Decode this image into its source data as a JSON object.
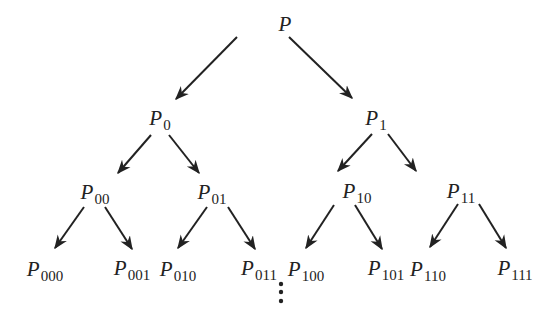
{
  "diagram": {
    "type": "binary-tree",
    "line_color": "#222222",
    "nodes": [
      {
        "id": "root",
        "base": "P",
        "sub": "",
        "x": 285,
        "y": 24
      },
      {
        "id": "n0",
        "base": "P",
        "sub": "0",
        "x": 160,
        "y": 118
      },
      {
        "id": "n1",
        "base": "P",
        "sub": "1",
        "x": 376,
        "y": 118
      },
      {
        "id": "n00",
        "base": "P",
        "sub": "00",
        "x": 95,
        "y": 192
      },
      {
        "id": "n01",
        "base": "P",
        "sub": "01",
        "x": 212,
        "y": 192
      },
      {
        "id": "n10",
        "base": "P",
        "sub": "10",
        "x": 357,
        "y": 191
      },
      {
        "id": "n11",
        "base": "P",
        "sub": "11",
        "x": 461,
        "y": 191
      },
      {
        "id": "n000",
        "base": "P",
        "sub": "000",
        "x": 45,
        "y": 269
      },
      {
        "id": "n001",
        "base": "P",
        "sub": "001",
        "x": 132,
        "y": 268
      },
      {
        "id": "n010",
        "base": "P",
        "sub": "010",
        "x": 178,
        "y": 269
      },
      {
        "id": "n011",
        "base": "P",
        "sub": "011",
        "x": 259,
        "y": 268
      },
      {
        "id": "n100",
        "base": "P",
        "sub": "100",
        "x": 306,
        "y": 269
      },
      {
        "id": "n101",
        "base": "P",
        "sub": "101",
        "x": 386,
        "y": 268
      },
      {
        "id": "n110",
        "base": "P",
        "sub": "110",
        "x": 428,
        "y": 269
      },
      {
        "id": "n111",
        "base": "P",
        "sub": "111",
        "x": 515,
        "y": 268
      }
    ],
    "edges": [
      {
        "from": "root",
        "to": "n0",
        "x1": 237,
        "y1": 37,
        "x2": 176,
        "y2": 99
      },
      {
        "from": "root",
        "to": "n1",
        "x1": 289,
        "y1": 37,
        "x2": 352,
        "y2": 98
      },
      {
        "from": "n0",
        "to": "n00",
        "x1": 151,
        "y1": 135,
        "x2": 118,
        "y2": 173
      },
      {
        "from": "n0",
        "to": "n01",
        "x1": 169,
        "y1": 135,
        "x2": 199,
        "y2": 173
      },
      {
        "from": "n1",
        "to": "n10",
        "x1": 372,
        "y1": 134,
        "x2": 338,
        "y2": 171
      },
      {
        "from": "n1",
        "to": "n11",
        "x1": 388,
        "y1": 134,
        "x2": 416,
        "y2": 171
      },
      {
        "from": "n00",
        "to": "n000",
        "x1": 84,
        "y1": 207,
        "x2": 55,
        "y2": 248
      },
      {
        "from": "n00",
        "to": "n001",
        "x1": 105,
        "y1": 207,
        "x2": 132,
        "y2": 249
      },
      {
        "from": "n01",
        "to": "n010",
        "x1": 207,
        "y1": 207,
        "x2": 178,
        "y2": 248
      },
      {
        "from": "n01",
        "to": "n011",
        "x1": 228,
        "y1": 207,
        "x2": 255,
        "y2": 249
      },
      {
        "from": "n10",
        "to": "n100",
        "x1": 334,
        "y1": 205,
        "x2": 306,
        "y2": 248
      },
      {
        "from": "n10",
        "to": "n101",
        "x1": 355,
        "y1": 205,
        "x2": 382,
        "y2": 249
      },
      {
        "from": "n11",
        "to": "n110",
        "x1": 458,
        "y1": 204,
        "x2": 430,
        "y2": 247
      },
      {
        "from": "n11",
        "to": "n111",
        "x1": 479,
        "y1": 204,
        "x2": 506,
        "y2": 248
      }
    ],
    "continuation": {
      "symbol": "vertical-ellipsis",
      "x": 281,
      "dots_y": [
        284,
        292,
        301
      ]
    }
  }
}
